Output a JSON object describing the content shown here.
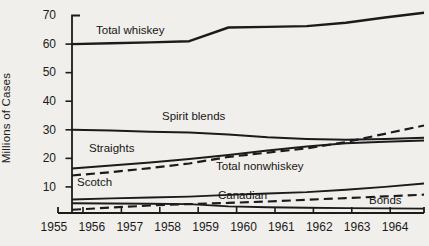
{
  "figure": {
    "background": "#f1efeb",
    "line_color": "#1b1b1b"
  },
  "chart_data": {
    "type": "line",
    "title": "",
    "xlabel": "",
    "ylabel": "Millions of Cases",
    "ylim": [
      0,
      70
    ],
    "grid": false,
    "legend_position": "inline-labels",
    "y_tick_labels": [
      "70",
      "60",
      "50",
      "40",
      "30",
      "20",
      "10"
    ],
    "years": [
      "1955",
      "1956",
      "1957",
      "1958",
      "1959",
      "1960",
      "1961",
      "1962",
      "1963",
      "1964"
    ],
    "series": [
      {
        "name": "Total whiskey",
        "style": "solid",
        "width": 2.4,
        "values": [
          60,
          60.3,
          60.6,
          61,
          65.8,
          66,
          66.3,
          67.5,
          69.3,
          71
        ]
      },
      {
        "name": "Spirit blends",
        "style": "solid",
        "width": 2.0,
        "values": [
          30,
          29.7,
          29.3,
          29,
          28.3,
          27.4,
          26.8,
          26.5,
          26.8,
          27.2
        ]
      },
      {
        "name": "Straights",
        "style": "solid",
        "width": 2.0,
        "values": [
          16.5,
          17.5,
          18.6,
          19.8,
          21.2,
          22.8,
          24.2,
          25.3,
          25.8,
          26.2
        ]
      },
      {
        "name": "Total nonwhiskey",
        "style": "dashed",
        "width": 2.2,
        "values": [
          14,
          15.2,
          16.6,
          18.2,
          20.5,
          22,
          23.5,
          25.7,
          28.6,
          31.5
        ]
      },
      {
        "name": "Scotch",
        "style": "solid",
        "width": 1.9,
        "values": [
          5.6,
          6,
          6.3,
          6.6,
          7.2,
          7.7,
          8.2,
          9,
          10,
          11.2
        ]
      },
      {
        "name": "Canadian",
        "style": "dashed",
        "width": 2.1,
        "values": [
          2,
          2.8,
          3.5,
          4,
          4.4,
          4.9,
          5.5,
          6.1,
          6.7,
          7.3
        ]
      },
      {
        "name": "Bonds",
        "style": "solid",
        "width": 1.9,
        "values": [
          4.3,
          4.2,
          4.1,
          4,
          3.2,
          2.9,
          2.7,
          2.6,
          2.5,
          2.4
        ]
      }
    ]
  }
}
